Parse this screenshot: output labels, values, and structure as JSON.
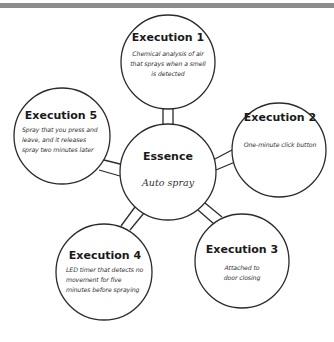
{
  "diagram": {
    "type": "mind-map",
    "center": {
      "title": "Essence",
      "text": "Auto spray"
    },
    "nodes": [
      {
        "title": "Execution 1",
        "text": "Chemical analysis of air that sprays when a smell is detected"
      },
      {
        "title": "Execution 2",
        "text": "One-minute click button"
      },
      {
        "title": "Execution 3",
        "text": "Attached to door closing"
      },
      {
        "title": "Execution 4",
        "text": "LED timer that detects no movement for five minutes before spraying"
      },
      {
        "title": "Execution 5",
        "text": "Spray that you press and leave, and it releases spray two minutes later"
      }
    ],
    "colors": {
      "stroke": "#2b2b2b",
      "topbar": "#8c8c8c",
      "background": "#ffffff"
    }
  }
}
